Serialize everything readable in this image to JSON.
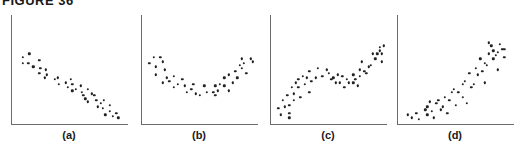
{
  "title": "FIGURE 36",
  "chart_data": [
    {
      "type": "scatter",
      "title": "",
      "label": "(a)",
      "xlabel": "",
      "ylabel": "",
      "grid": false,
      "description": "strong negative linear correlation",
      "xlim": [
        0,
        100
      ],
      "ylim": [
        0,
        100
      ],
      "points": [
        [
          7,
          80
        ],
        [
          13,
          84
        ],
        [
          7,
          72
        ],
        [
          12,
          72
        ],
        [
          16,
          68
        ],
        [
          17,
          68
        ],
        [
          22,
          76
        ],
        [
          23,
          66
        ],
        [
          22,
          60
        ],
        [
          28,
          64
        ],
        [
          27,
          54
        ],
        [
          29,
          58
        ],
        [
          36,
          52
        ],
        [
          39,
          54
        ],
        [
          40,
          46
        ],
        [
          46,
          48
        ],
        [
          48,
          42
        ],
        [
          51,
          52
        ],
        [
          52,
          46
        ],
        [
          52,
          38
        ],
        [
          55,
          40
        ],
        [
          60,
          44
        ],
        [
          61,
          36
        ],
        [
          62,
          32
        ],
        [
          64,
          28
        ],
        [
          66,
          40
        ],
        [
          66,
          24
        ],
        [
          70,
          34
        ],
        [
          72,
          32
        ],
        [
          74,
          26
        ],
        [
          75,
          18
        ],
        [
          78,
          22
        ],
        [
          80,
          16
        ],
        [
          81,
          26
        ],
        [
          82,
          8
        ],
        [
          86,
          20
        ],
        [
          86,
          12
        ],
        [
          89,
          6
        ],
        [
          92,
          10
        ],
        [
          94,
          4
        ]
      ]
    },
    {
      "type": "scatter",
      "title": "",
      "label": "(b)",
      "xlabel": "",
      "ylabel": "",
      "grid": false,
      "description": "U-shaped (quadratic) relationship",
      "xlim": [
        0,
        100
      ],
      "ylim": [
        0,
        100
      ],
      "points": [
        [
          4,
          72
        ],
        [
          8,
          80
        ],
        [
          10,
          68
        ],
        [
          14,
          80
        ],
        [
          10,
          58
        ],
        [
          16,
          74
        ],
        [
          18,
          64
        ],
        [
          20,
          54
        ],
        [
          16,
          48
        ],
        [
          22,
          50
        ],
        [
          26,
          56
        ],
        [
          26,
          42
        ],
        [
          30,
          46
        ],
        [
          34,
          52
        ],
        [
          36,
          44
        ],
        [
          38,
          36
        ],
        [
          42,
          40
        ],
        [
          44,
          46
        ],
        [
          46,
          34
        ],
        [
          50,
          32
        ],
        [
          54,
          44
        ],
        [
          56,
          36
        ],
        [
          62,
          36
        ],
        [
          64,
          44
        ],
        [
          64,
          32
        ],
        [
          66,
          38
        ],
        [
          68,
          46
        ],
        [
          72,
          44
        ],
        [
          72,
          54
        ],
        [
          76,
          58
        ],
        [
          76,
          38
        ],
        [
          80,
          48
        ],
        [
          82,
          62
        ],
        [
          84,
          54
        ],
        [
          86,
          70
        ],
        [
          88,
          66
        ],
        [
          88,
          78
        ],
        [
          90,
          72
        ],
        [
          92,
          60
        ],
        [
          96,
          78
        ],
        [
          98,
          74
        ]
      ]
    },
    {
      "type": "scatter",
      "title": "",
      "label": "(c)",
      "xlabel": "",
      "ylabel": "",
      "grid": false,
      "description": "cubic / S-shaped trend: rise, plateau, rise",
      "xlim": [
        0,
        100
      ],
      "ylim": [
        0,
        100
      ],
      "points": [
        [
          4,
          16
        ],
        [
          6,
          8
        ],
        [
          8,
          26
        ],
        [
          10,
          18
        ],
        [
          12,
          32
        ],
        [
          14,
          10
        ],
        [
          14,
          20
        ],
        [
          14,
          4
        ],
        [
          16,
          42
        ],
        [
          18,
          26
        ],
        [
          18,
          34
        ],
        [
          20,
          48
        ],
        [
          22,
          42
        ],
        [
          22,
          52
        ],
        [
          24,
          30
        ],
        [
          26,
          56
        ],
        [
          28,
          46
        ],
        [
          30,
          54
        ],
        [
          32,
          36
        ],
        [
          32,
          62
        ],
        [
          34,
          50
        ],
        [
          38,
          54
        ],
        [
          40,
          66
        ],
        [
          44,
          56
        ],
        [
          48,
          64
        ],
        [
          50,
          60
        ],
        [
          52,
          52
        ],
        [
          54,
          54
        ],
        [
          56,
          48
        ],
        [
          58,
          58
        ],
        [
          60,
          48
        ],
        [
          62,
          56
        ],
        [
          64,
          42
        ],
        [
          66,
          52
        ],
        [
          68,
          48
        ],
        [
          72,
          48
        ],
        [
          72,
          58
        ],
        [
          74,
          52
        ],
        [
          76,
          44
        ],
        [
          78,
          64
        ],
        [
          78,
          56
        ],
        [
          80,
          74
        ],
        [
          82,
          62
        ],
        [
          84,
          60
        ],
        [
          86,
          68
        ],
        [
          88,
          70
        ],
        [
          90,
          84
        ],
        [
          92,
          78
        ],
        [
          94,
          84
        ],
        [
          96,
          88
        ],
        [
          96,
          92
        ],
        [
          98,
          84
        ],
        [
          98,
          74
        ],
        [
          100,
          94
        ]
      ]
    },
    {
      "type": "scatter",
      "title": "",
      "label": "(d)",
      "xlabel": "",
      "ylabel": "",
      "grid": false,
      "description": "positive curvilinear (exponential-like) relationship",
      "xlim": [
        0,
        100
      ],
      "ylim": [
        0,
        100
      ],
      "points": [
        [
          6,
          8
        ],
        [
          10,
          4
        ],
        [
          14,
          10
        ],
        [
          16,
          2
        ],
        [
          22,
          14
        ],
        [
          24,
          8
        ],
        [
          24,
          18
        ],
        [
          26,
          24
        ],
        [
          28,
          12
        ],
        [
          30,
          4
        ],
        [
          32,
          22
        ],
        [
          34,
          26
        ],
        [
          36,
          14
        ],
        [
          38,
          18
        ],
        [
          40,
          30
        ],
        [
          42,
          10
        ],
        [
          44,
          26
        ],
        [
          46,
          36
        ],
        [
          48,
          40
        ],
        [
          50,
          20
        ],
        [
          52,
          36
        ],
        [
          56,
          30
        ],
        [
          56,
          46
        ],
        [
          58,
          50
        ],
        [
          60,
          22
        ],
        [
          62,
          60
        ],
        [
          64,
          42
        ],
        [
          66,
          46
        ],
        [
          68,
          66
        ],
        [
          70,
          58
        ],
        [
          72,
          78
        ],
        [
          74,
          62
        ],
        [
          76,
          48
        ],
        [
          76,
          72
        ],
        [
          78,
          70
        ],
        [
          80,
          84
        ],
        [
          80,
          98
        ],
        [
          82,
          94
        ],
        [
          84,
          78
        ],
        [
          84,
          88
        ],
        [
          86,
          82
        ],
        [
          88,
          86
        ],
        [
          88,
          64
        ],
        [
          90,
          96
        ],
        [
          92,
          90
        ],
        [
          94,
          90
        ],
        [
          94,
          80
        ]
      ]
    }
  ]
}
